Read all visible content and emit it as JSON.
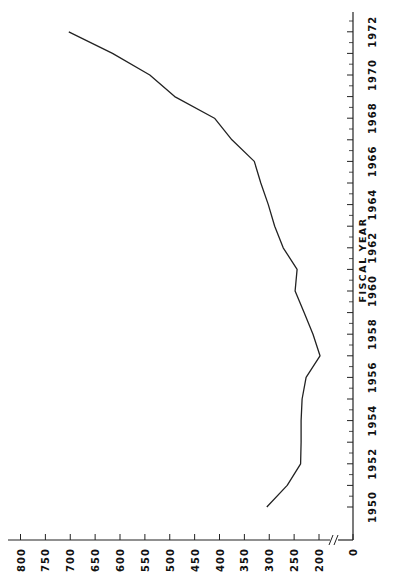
{
  "chart_data": {
    "type": "line",
    "orientation": "rotated-90",
    "title": "",
    "xlabel": "FISCAL YEAR",
    "ylabel": "",
    "x": [
      1950,
      1951,
      1952,
      1953,
      1954,
      1955,
      1956,
      1957,
      1958,
      1959,
      1960,
      1961,
      1962,
      1963,
      1964,
      1965,
      1966,
      1967,
      1968,
      1969,
      1970,
      1971,
      1972
    ],
    "series": [
      {
        "name": "",
        "values": [
          305,
          264,
          237,
          236,
          236,
          234,
          226,
          198,
          212,
          230,
          248,
          244,
          272,
          289,
          302,
          317,
          330,
          375,
          410,
          490,
          540,
          615,
          703
        ]
      }
    ],
    "x_ticks": [
      "1950",
      "1952",
      "1954",
      "1956",
      "1958",
      "1960",
      "1962",
      "1964",
      "1966",
      "1968",
      "1970",
      "1972"
    ],
    "y_ticks": [
      "0",
      "200",
      "250",
      "300",
      "350",
      "400",
      "450",
      "500",
      "550",
      "600",
      "650",
      "700",
      "750",
      "800"
    ],
    "ylim": [
      0,
      800
    ],
    "axis_break": "between 0 and 200",
    "grid": false,
    "legend": null
  }
}
